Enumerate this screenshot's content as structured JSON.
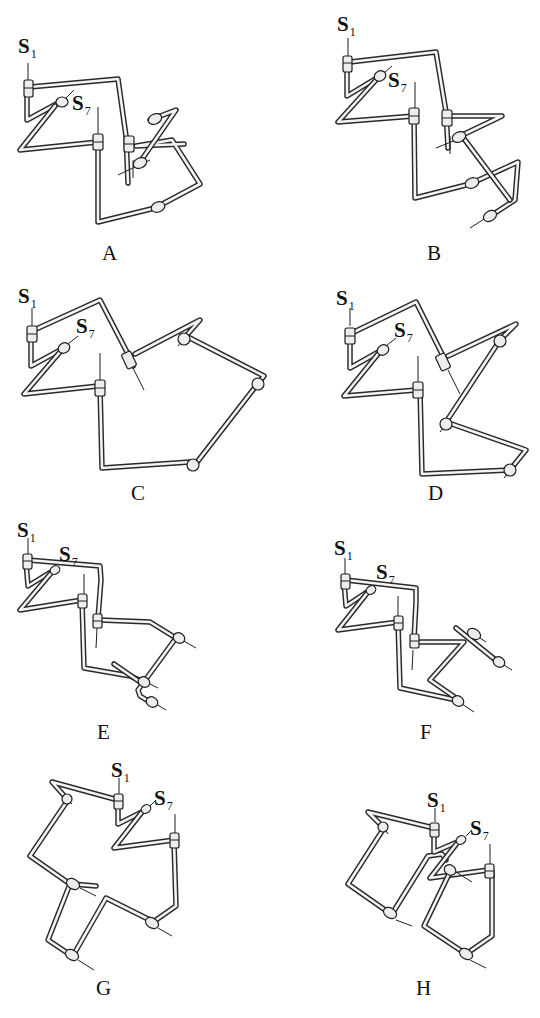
{
  "figure": {
    "panels": [
      {
        "id": "A",
        "label": "A",
        "s1_label": "S",
        "s1_sub": "1",
        "s7_label": "S",
        "s7_sub": "7"
      },
      {
        "id": "B",
        "label": "B",
        "s1_label": "S",
        "s1_sub": "1",
        "s7_label": "S",
        "s7_sub": "7"
      },
      {
        "id": "C",
        "label": "C",
        "s1_label": "S",
        "s1_sub": "1",
        "s7_label": "S",
        "s7_sub": "7"
      },
      {
        "id": "D",
        "label": "D",
        "s1_label": "S",
        "s1_sub": "1",
        "s7_label": "S",
        "s7_sub": "7"
      },
      {
        "id": "E",
        "label": "E",
        "s1_label": "S",
        "s1_sub": "1",
        "s7_label": "S",
        "s7_sub": "7"
      },
      {
        "id": "F",
        "label": "F",
        "s1_label": "S",
        "s1_sub": "1",
        "s7_label": "S",
        "s7_sub": "7"
      },
      {
        "id": "G",
        "label": "G",
        "s1_label": "S",
        "s1_sub": "1",
        "s7_label": "S",
        "s7_sub": "7"
      },
      {
        "id": "H",
        "label": "H",
        "s1_label": "S",
        "s1_sub": "1",
        "s7_label": "S",
        "s7_sub": "7"
      }
    ],
    "colors": {
      "line": "#2a2a2a",
      "tube_fill": "#f4f4f4",
      "background": "#ffffff"
    }
  }
}
